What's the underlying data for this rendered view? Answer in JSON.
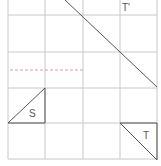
{
  "diagram": {
    "type": "grid-transformation",
    "grid": {
      "x_lines": [
        8,
        45,
        83,
        120,
        157
      ],
      "y_lines": [
        15,
        52,
        88,
        123,
        159
      ],
      "top_extent": 0,
      "color": "#c8c8c8"
    },
    "dashed_line": {
      "x1": 10,
      "y1": 70,
      "x2": 83,
      "y2": 70,
      "color": "#d9a0a0"
    },
    "diagonal_line": {
      "x1": 65,
      "y1": 0,
      "x2": 157,
      "y2": 87,
      "color": "#555555"
    },
    "shapes": [
      {
        "name": "S",
        "label": "S",
        "points": "8,123 45,88 45,123",
        "label_x": 29,
        "label_y": 117
      },
      {
        "name": "T",
        "label": "T",
        "points": "120,123 157,123 157,160",
        "label_x": 143,
        "label_y": 139
      }
    ],
    "image_label": {
      "label": "T'",
      "x": 122,
      "y": 11
    }
  }
}
